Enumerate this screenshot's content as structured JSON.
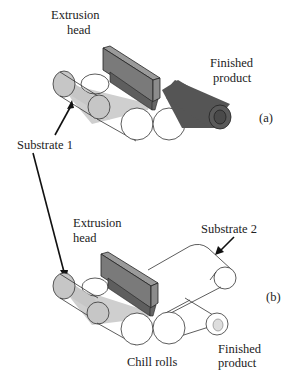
{
  "panel_a": {
    "tag": "(a)",
    "extrusion_head_line1": "Extrusion",
    "extrusion_head_line2": "head",
    "finished_line1": "Finished",
    "finished_line2": "product"
  },
  "panel_b": {
    "tag": "(b)",
    "extrusion_head_line1": "Extrusion",
    "extrusion_head_line2": "head",
    "substrate2": "Substrate 2",
    "chill_rolls": "Chill rolls",
    "finished_line1": "Finished",
    "finished_line2": "product"
  },
  "shared": {
    "substrate1": "Substrate 1"
  },
  "colors": {
    "substrate_light": "#c2c2c2",
    "head_dark": "#6e6e6e",
    "head_face": "#8a8a8a",
    "product_dark": "#555555",
    "line": "#222222"
  }
}
